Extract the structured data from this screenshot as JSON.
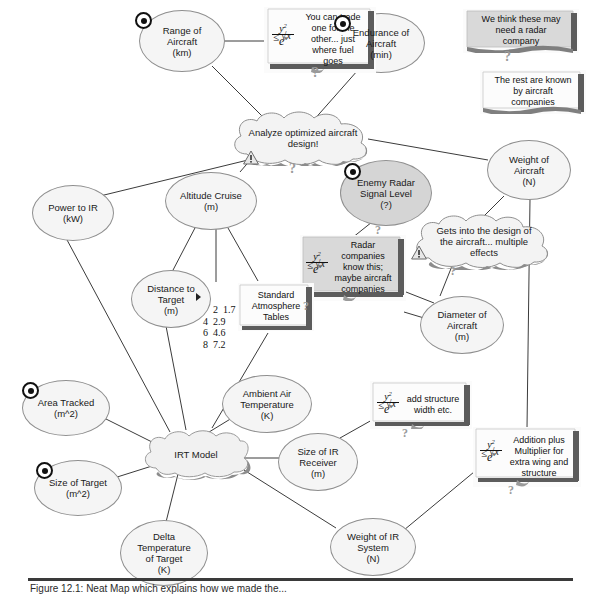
{
  "figure": {
    "caption": "Figure 12.1: Neat Map which explains how we made the..."
  },
  "icons": {
    "bullseye": "target-icon",
    "warning": "warning-triangle-icon",
    "question": "question-mark-icon"
  },
  "formula": {
    "numerator": "y2",
    "relation": "≤",
    "radical": "√x",
    "denominator": "ex",
    "plain": "y² ≤ √x / eˣ"
  },
  "nodes": [
    {
      "id": "range-of-aircraft",
      "label": "Range of\nAircraft\n(km)",
      "shape": "oval",
      "fill": "light",
      "icon": "bullseye",
      "x": 139,
      "y": 10,
      "w": 86,
      "h": 62
    },
    {
      "id": "endurance-of-aircraft",
      "label": "Endurance of\nAircraft\n(min)",
      "shape": "oval",
      "fill": "light",
      "icon": "bullseye",
      "x": 337,
      "y": 13,
      "w": 88,
      "h": 60
    },
    {
      "id": "analyze-optimized",
      "label": "Analyze optimized aircraft\ndesign!",
      "shape": "cloud",
      "fill": "light",
      "icon": "warning",
      "x": 227,
      "y": 110,
      "w": 152,
      "h": 56
    },
    {
      "id": "power-to-ir",
      "label": "Power to IR\n(kW)",
      "shape": "oval",
      "fill": "light",
      "icon": "none",
      "x": 32,
      "y": 185,
      "w": 82,
      "h": 56
    },
    {
      "id": "altitude-cruise",
      "label": "Altitude Cruise\n(m)",
      "shape": "oval",
      "fill": "light",
      "icon": "none",
      "x": 165,
      "y": 172,
      "w": 92,
      "h": 58
    },
    {
      "id": "enemy-radar-signal",
      "label": "Enemy Radar\nSignal Level\n(?)",
      "shape": "oval",
      "fill": "gray",
      "icon": "bullseye",
      "x": 340,
      "y": 160,
      "w": 92,
      "h": 66
    },
    {
      "id": "weight-of-aircraft",
      "label": "Weight  of\nAircraft\n(N)",
      "shape": "oval",
      "fill": "light",
      "icon": "none",
      "x": 487,
      "y": 140,
      "w": 84,
      "h": 60
    },
    {
      "id": "gets-into-design",
      "label": "Gets into the design of\nthe aircraft... multiple\neffects",
      "shape": "cloud",
      "fill": "light",
      "icon": "warning",
      "x": 409,
      "y": 212,
      "w": 150,
      "h": 58
    },
    {
      "id": "distance-to-target",
      "label": "Distance to\nTarget\n(m)",
      "shape": "oval",
      "fill": "light",
      "icon": "none",
      "x": 131,
      "y": 270,
      "w": 80,
      "h": 58
    },
    {
      "id": "diameter-of-aircraft",
      "label": "Diameter of\nAircraft\n(m)",
      "shape": "oval",
      "fill": "light",
      "icon": "none",
      "x": 420,
      "y": 296,
      "w": 84,
      "h": 58
    },
    {
      "id": "area-tracked",
      "label": "Area Tracked\n(m^2)",
      "shape": "oval",
      "fill": "light",
      "icon": "bullseye",
      "x": 22,
      "y": 380,
      "w": 88,
      "h": 56
    },
    {
      "id": "ambient-air-temperature",
      "label": "Ambient  Air\nTemperature\n(K)",
      "shape": "oval",
      "fill": "light",
      "icon": "none",
      "x": 222,
      "y": 375,
      "w": 90,
      "h": 58
    },
    {
      "id": "size-of-target",
      "label": "Size of Target\n(m^2)",
      "shape": "oval",
      "fill": "light",
      "icon": "bullseye",
      "x": 34,
      "y": 460,
      "w": 88,
      "h": 56
    },
    {
      "id": "irt-model",
      "label": "IRT  Model",
      "shape": "cloud",
      "fill": "light",
      "icon": "none",
      "x": 140,
      "y": 428,
      "w": 112,
      "h": 52
    },
    {
      "id": "size-of-ir-receiver",
      "label": "Size of IR\nReceiver\n(m)",
      "shape": "oval",
      "fill": "light",
      "icon": "none",
      "x": 278,
      "y": 433,
      "w": 80,
      "h": 58
    },
    {
      "id": "delta-temperature",
      "label": "Delta\nTemperature\nof Target\n(K)",
      "shape": "oval",
      "fill": "light",
      "icon": "none",
      "x": 120,
      "y": 520,
      "w": 88,
      "h": 66
    },
    {
      "id": "weight-of-ir-system",
      "label": "Weight of IR\nSystem\n(N)",
      "shape": "oval",
      "fill": "light",
      "icon": "none",
      "x": 330,
      "y": 518,
      "w": 86,
      "h": 58
    }
  ],
  "notes": [
    {
      "id": "trade-one-for-other",
      "text": "You can trade\none for the\nother... just\nwhere fuel\ngoes",
      "fill": "white",
      "formula": true,
      "x": 264,
      "y": 7,
      "w": 112,
      "h": 66
    },
    {
      "id": "need-radar-company",
      "text": "We think these may\nneed a radar\ncompany",
      "fill": "gray",
      "formula": false,
      "x": 463,
      "y": 9,
      "w": 116,
      "h": 44
    },
    {
      "id": "known-by-aircraft",
      "text": "The rest are known\nby aircraft\ncompanies",
      "fill": "white",
      "formula": false,
      "x": 480,
      "y": 70,
      "w": 106,
      "h": 44
    },
    {
      "id": "radar-companies-know",
      "text": "Radar\ncompanies\nknow this;\nmaybe aircraft\ncompanies",
      "fill": "gray",
      "formula": true,
      "x": 300,
      "y": 235,
      "w": 106,
      "h": 66
    },
    {
      "id": "standard-atmosphere-tables",
      "text": "Standard\nAtmosphere\nTables",
      "fill": "white",
      "formula": false,
      "x": 238,
      "y": 283,
      "w": 76,
      "h": 48
    },
    {
      "id": "add-structure-width",
      "text": "add structure\nwidth etc.",
      "fill": "white",
      "formula": true,
      "x": 370,
      "y": 381,
      "w": 102,
      "h": 48
    },
    {
      "id": "addition-plus-multiplier",
      "text": "Addition plus\nMultiplier for\nextra wing and\nstructure",
      "fill": "white",
      "formula": true,
      "x": 473,
      "y": 427,
      "w": 108,
      "h": 60
    }
  ],
  "number_table": {
    "id": "atmosphere-values",
    "rows": [
      {
        "left": "2",
        "right": "1.7"
      },
      {
        "left": "4",
        "right": "2.9"
      },
      {
        "left": "6",
        "right": "4.6"
      },
      {
        "left": "8",
        "right": "7.2"
      }
    ],
    "text": "2  1.7\n4  2.9\n6  4.6\n8  7.2"
  },
  "colors": {
    "node_fill_light": "#f5f5f5",
    "node_fill_gray": "#d5d5d5",
    "node_shadow": "#8c8c8c",
    "note_gray": "#d9d9d9",
    "note_white": "#fbfbfb",
    "line": "#3b3b3b",
    "text": "#1a1a1a"
  }
}
